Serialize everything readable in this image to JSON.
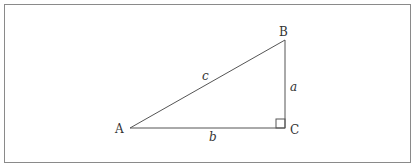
{
  "figure": {
    "frame": {
      "x": 4,
      "y": 4,
      "width": 407,
      "height": 159,
      "stroke": "#888888"
    },
    "triangle": {
      "vertices": {
        "A": {
          "label": "A",
          "x": 130,
          "y": 128
        },
        "B": {
          "label": "B",
          "x": 285,
          "y": 40
        },
        "C": {
          "label": "C",
          "x": 285,
          "y": 128
        }
      },
      "sides": {
        "a": {
          "label": "a",
          "between": [
            "B",
            "C"
          ]
        },
        "b": {
          "label": "b",
          "between": [
            "A",
            "C"
          ]
        },
        "c": {
          "label": "c",
          "between": [
            "A",
            "B"
          ]
        }
      },
      "right_angle_at": "C",
      "stroke": "#555555"
    }
  }
}
